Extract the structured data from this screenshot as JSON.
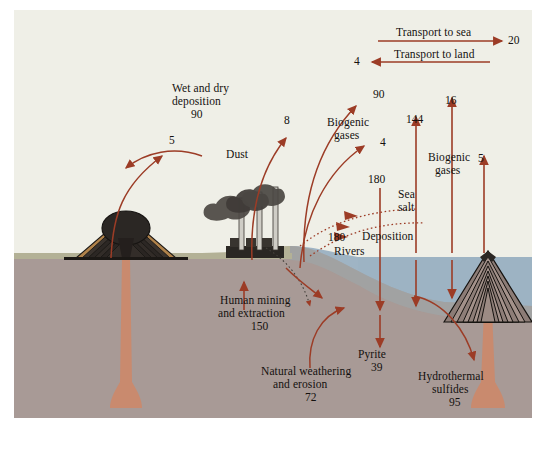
{
  "diagram": {
    "units_note": "",
    "colors": {
      "arrow": "#9c3c26",
      "background": "#efefe7",
      "ocean": "#9fb4c4",
      "ocean_deep": "#8ba3b6",
      "crust": "#a89a96",
      "land_surface": "#b0ae92",
      "magma": "#c98a6e",
      "volcano_dark": "#2e2a27",
      "text": "#14110f"
    },
    "flows": [
      {
        "id": "transport-to-sea",
        "label": "Transport to sea",
        "value": "20",
        "direction": "right"
      },
      {
        "id": "transport-to-land",
        "label": "Transport to land",
        "value": "4",
        "direction": "left"
      },
      {
        "id": "wet-dry-deposition",
        "label": "Wet and dry deposition",
        "value": "90"
      },
      {
        "id": "deposition-land-5",
        "label": "",
        "value": "5"
      },
      {
        "id": "dust",
        "label": "Dust",
        "value": "8"
      },
      {
        "id": "biogenic-gases-land",
        "label": "Biogenic gases",
        "value": "4"
      },
      {
        "id": "sea-deposition-90",
        "label": "",
        "value": "90"
      },
      {
        "id": "sea-emission-144",
        "label": "",
        "value": "144"
      },
      {
        "id": "biogenic-gases-sea",
        "label": "Biogenic gases",
        "value": "16"
      },
      {
        "id": "biogenic-gases-vent",
        "label": "Biogenic gases",
        "value": "5"
      },
      {
        "id": "sea-salt",
        "label": "Sea salt",
        "value": "180"
      },
      {
        "id": "deposition-ocean",
        "label": "Deposition",
        "value": ""
      },
      {
        "id": "rivers",
        "label": "Rivers",
        "value": "180"
      },
      {
        "id": "human-mining",
        "label": "Human mining and extraction",
        "value": "150"
      },
      {
        "id": "natural-weathering",
        "label": "Natural weathering and erosion",
        "value": "72"
      },
      {
        "id": "pyrite",
        "label": "Pyrite",
        "value": "39"
      },
      {
        "id": "hydrothermal",
        "label": "Hydrothermal sulfides",
        "value": "95"
      }
    ],
    "labels": {
      "transport_to_sea": "Transport to sea",
      "transport_to_sea_value": "20",
      "transport_to_land": "Transport to land",
      "transport_to_land_value": "4",
      "wet_dry_line1": "Wet and dry",
      "wet_dry_line2": "deposition",
      "wet_dry_value": "90",
      "left_deposition_value": "5",
      "dust": "Dust",
      "dust_value": "8",
      "biogenic_land_line1": "Biogenic",
      "biogenic_land_line2": "gases",
      "biogenic_land_value": "4",
      "sea_deposition_value": "90",
      "sea_emission_value": "144",
      "biogenic_sea_value": "16",
      "biogenic_sea_line1": "Biogenic",
      "biogenic_sea_line2": "gases",
      "biogenic_vent_value": "5",
      "sea_salt_value": "180",
      "sea_salt_line1": "Sea",
      "sea_salt_line2": "salt",
      "deposition": "Deposition",
      "rivers_value": "180",
      "rivers": "Rivers",
      "human_line1": "Human mining",
      "human_line2": "and extraction",
      "human_value": "150",
      "natural_line1": "Natural weathering",
      "natural_line2": "and erosion",
      "natural_value": "72",
      "pyrite": "Pyrite",
      "pyrite_value": "39",
      "hydrothermal_line1": "Hydrothermal",
      "hydrothermal_line2": "sulfides",
      "hydrothermal_value": "95"
    }
  }
}
